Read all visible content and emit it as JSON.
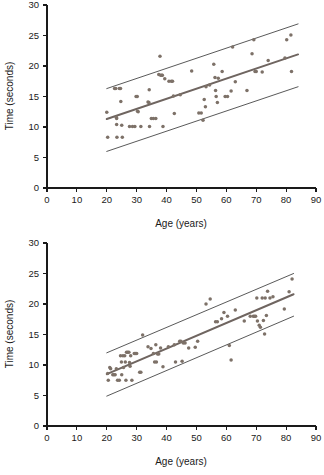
{
  "figure": {
    "title": "",
    "panels": [
      "top",
      "bottom"
    ]
  },
  "chart_data": [
    {
      "id": "top",
      "type": "scatter",
      "title": "",
      "xlabel": "Age (years)",
      "ylabel": "Time (seconds)",
      "xlim": [
        0,
        90
      ],
      "ylim": [
        0,
        30
      ],
      "xticks": [
        0,
        10,
        20,
        30,
        40,
        50,
        60,
        70,
        80,
        90
      ],
      "yticks": [
        0,
        5,
        10,
        15,
        20,
        25,
        30
      ],
      "grid": false,
      "legend": "none",
      "marker_color": "#7d7168",
      "fit_color": "#6f6560",
      "band_color": "#3b3b3b",
      "annotations": [],
      "series": [
        {
          "name": "observations",
          "points": [
            [
              20.0,
              12.4
            ],
            [
              20.3,
              8.3
            ],
            [
              22.6,
              16.3
            ],
            [
              23.0,
              16.3
            ],
            [
              23.2,
              11.6
            ],
            [
              23.3,
              11.4
            ],
            [
              23.3,
              10.4
            ],
            [
              23.4,
              8.3
            ],
            [
              24.2,
              16.3
            ],
            [
              24.6,
              16.3
            ],
            [
              24.7,
              14.2
            ],
            [
              25.0,
              10.3
            ],
            [
              25.2,
              8.3
            ],
            [
              27.6,
              10.1
            ],
            [
              28.6,
              10.1
            ],
            [
              29.4,
              10.1
            ],
            [
              29.8,
              15.0
            ],
            [
              30.2,
              15.0
            ],
            [
              30.3,
              12.6
            ],
            [
              30.5,
              12.5
            ],
            [
              31.4,
              10.1
            ],
            [
              33.8,
              14.1
            ],
            [
              34.1,
              14.0
            ],
            [
              34.2,
              16.1
            ],
            [
              34.3,
              10.1
            ],
            [
              34.9,
              11.4
            ],
            [
              35.6,
              11.4
            ],
            [
              36.4,
              11.4
            ],
            [
              37.4,
              18.6
            ],
            [
              37.8,
              21.6
            ],
            [
              38.0,
              18.5
            ],
            [
              38.4,
              18.5
            ],
            [
              38.6,
              18.5
            ],
            [
              38.8,
              10.1
            ],
            [
              39.4,
              17.9
            ],
            [
              40.8,
              17.5
            ],
            [
              41.6,
              17.5
            ],
            [
              42.0,
              17.5
            ],
            [
              42.3,
              15.1
            ],
            [
              42.6,
              12.2
            ],
            [
              44.6,
              15.3
            ],
            [
              48.4,
              19.2
            ],
            [
              50.8,
              12.3
            ],
            [
              51.6,
              12.3
            ],
            [
              52.2,
              11.1
            ],
            [
              52.6,
              14.5
            ],
            [
              53.0,
              13.3
            ],
            [
              53.2,
              16.6
            ],
            [
              54.4,
              16.9
            ],
            [
              55.8,
              20.3
            ],
            [
              56.2,
              18.1
            ],
            [
              56.4,
              16.0
            ],
            [
              56.6,
              15.0
            ],
            [
              57.0,
              14.0
            ],
            [
              57.3,
              18.0
            ],
            [
              58.6,
              19.1
            ],
            [
              59.6,
              15.0
            ],
            [
              60.4,
              15.0
            ],
            [
              61.6,
              15.9
            ],
            [
              62.1,
              23.1
            ],
            [
              63.0,
              17.4
            ],
            [
              66.9,
              16.0
            ],
            [
              68.6,
              22.0
            ],
            [
              69.2,
              24.3
            ],
            [
              69.6,
              19.1
            ],
            [
              70.0,
              19.1
            ],
            [
              72.0,
              19.0
            ],
            [
              74.0,
              20.9
            ],
            [
              79.6,
              21.3
            ],
            [
              80.2,
              24.3
            ],
            [
              81.6,
              25.1
            ],
            [
              81.8,
              19.1
            ]
          ]
        }
      ],
      "fit_line": {
        "x": [
          20.0,
          84.0
        ],
        "y": [
          11.3,
          21.9
        ]
      },
      "upper_band": {
        "x": [
          20.0,
          84.0
        ],
        "y": [
          16.3,
          26.9
        ]
      },
      "lower_band": {
        "x": [
          20.0,
          84.0
        ],
        "y": [
          6.0,
          16.6
        ]
      }
    },
    {
      "id": "bottom",
      "type": "scatter",
      "title": "",
      "xlabel": "Age (years)",
      "ylabel": "Time (seconds)",
      "xlim": [
        0,
        90
      ],
      "ylim": [
        0,
        30
      ],
      "xticks": [
        0,
        10,
        20,
        30,
        40,
        50,
        60,
        70,
        80,
        90
      ],
      "yticks": [
        0,
        5,
        10,
        15,
        20,
        25,
        30
      ],
      "grid": false,
      "legend": "none",
      "marker_color": "#7d7168",
      "fit_color": "#6f6560",
      "band_color": "#3b3b3b",
      "annotations": [],
      "series": [
        {
          "name": "observations",
          "points": [
            [
              20.3,
              8.6
            ],
            [
              20.5,
              7.5
            ],
            [
              21.0,
              9.6
            ],
            [
              21.3,
              9.4
            ],
            [
              22.0,
              8.4
            ],
            [
              22.4,
              8.4
            ],
            [
              22.8,
              8.4
            ],
            [
              23.2,
              9.4
            ],
            [
              23.6,
              7.5
            ],
            [
              24.2,
              7.5
            ],
            [
              24.6,
              11.5
            ],
            [
              24.9,
              10.5
            ],
            [
              25.0,
              8.4
            ],
            [
              25.4,
              11.5
            ],
            [
              25.6,
              9.6
            ],
            [
              26.0,
              11.5
            ],
            [
              26.2,
              10.5
            ],
            [
              26.4,
              7.5
            ],
            [
              26.6,
              12.1
            ],
            [
              27.0,
              12.1
            ],
            [
              27.4,
              12.1
            ],
            [
              27.6,
              10.4
            ],
            [
              27.8,
              9.8
            ],
            [
              28.0,
              11.5
            ],
            [
              28.4,
              7.5
            ],
            [
              29.2,
              11.9
            ],
            [
              29.6,
              11.9
            ],
            [
              30.0,
              11.9
            ],
            [
              31.0,
              8.8
            ],
            [
              31.4,
              8.8
            ],
            [
              32.0,
              14.9
            ],
            [
              33.8,
              13.0
            ],
            [
              34.8,
              12.7
            ],
            [
              35.6,
              11.9
            ],
            [
              36.0,
              10.5
            ],
            [
              36.4,
              13.3
            ],
            [
              36.6,
              10.5
            ],
            [
              37.0,
              11.8
            ],
            [
              37.4,
              11.8
            ],
            [
              38.0,
              12.8
            ],
            [
              38.8,
              9.7
            ],
            [
              40.6,
              13.0
            ],
            [
              42.6,
              13.3
            ],
            [
              43.0,
              10.5
            ],
            [
              44.4,
              13.9
            ],
            [
              44.8,
              13.9
            ],
            [
              45.2,
              10.6
            ],
            [
              45.6,
              13.6
            ],
            [
              46.2,
              13.6
            ],
            [
              47.4,
              12.8
            ],
            [
              49.6,
              12.9
            ],
            [
              50.4,
              13.9
            ],
            [
              53.2,
              20.0
            ],
            [
              54.6,
              20.8
            ],
            [
              56.4,
              17.1
            ],
            [
              57.0,
              17.1
            ],
            [
              58.4,
              17.6
            ],
            [
              59.2,
              18.6
            ],
            [
              60.4,
              18.0
            ],
            [
              61.0,
              13.2
            ],
            [
              61.6,
              10.8
            ],
            [
              63.0,
              19.0
            ],
            [
              66.0,
              17.2
            ],
            [
              68.0,
              18.0
            ],
            [
              69.0,
              18.0
            ],
            [
              69.4,
              18.0
            ],
            [
              69.8,
              18.0
            ],
            [
              70.2,
              21.0
            ],
            [
              70.4,
              17.2
            ],
            [
              71.0,
              16.5
            ],
            [
              71.4,
              16.2
            ],
            [
              72.0,
              21.0
            ],
            [
              72.4,
              17.3
            ],
            [
              72.8,
              15.1
            ],
            [
              73.0,
              21.0
            ],
            [
              73.4,
              18.1
            ],
            [
              73.8,
              22.1
            ],
            [
              74.6,
              21.0
            ],
            [
              75.6,
              21.2
            ],
            [
              79.4,
              19.2
            ],
            [
              81.0,
              22.0
            ],
            [
              82.0,
              24.1
            ]
          ]
        }
      ],
      "fit_line": {
        "x": [
          20.0,
          82.5
        ],
        "y": [
          8.5,
          21.6
        ]
      },
      "upper_band": {
        "x": [
          20.0,
          82.5
        ],
        "y": [
          12.0,
          25.0
        ]
      },
      "lower_band": {
        "x": [
          20.0,
          82.5
        ],
        "y": [
          4.9,
          18.0
        ]
      }
    }
  ]
}
